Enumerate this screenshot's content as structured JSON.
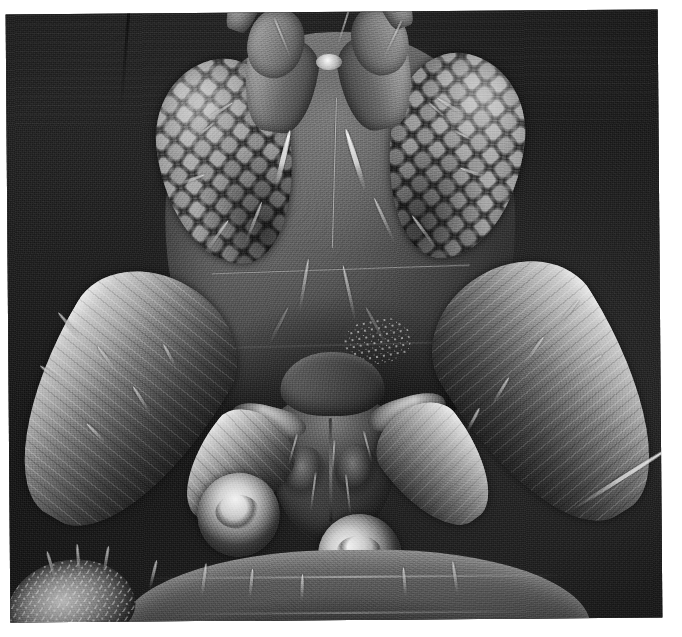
{
  "figure": {
    "type": "scanning-electron-micrograph",
    "colour_mode": "greyscale",
    "scale_bar_present": false,
    "caption_present": false,
    "border": {
      "style": "white paper margin",
      "colour": "#ffffff",
      "left_px": 8,
      "top_px": 12,
      "right_px": 22,
      "bottom_px": 17
    },
    "plate": {
      "background_colour": "#121212",
      "highlight_colour": "#f2f2f2",
      "midtone_colour": "#6a6a6a",
      "rotation_deg": -0.45
    }
  },
  "anatomy": {
    "head_capsule": {
      "label": "head capsule",
      "description": "broad rounded frons with fine punctate cuticle and scattered pale setae"
    },
    "eyes": [
      {
        "label": "compound eye (left)",
        "side": "left",
        "facets": "coarse ommatidia in overlapping rows"
      },
      {
        "label": "compound eye (right)",
        "side": "right",
        "facets": "coarse ommatidia in overlapping rows"
      }
    ],
    "antennae": [
      {
        "label": "antenna (left)",
        "side": "left",
        "segments": [
          "scape",
          "pedicel",
          "flagellum"
        ]
      },
      {
        "label": "antenna (right)",
        "side": "right",
        "segments": [
          "scape",
          "pedicel",
          "flagellum"
        ]
      }
    ],
    "mouthparts": {
      "label": "mouthparts",
      "parts": [
        "labrum",
        "labium",
        "maxillary palp"
      ]
    },
    "appendages": [
      {
        "label": "foreleg femur (left)",
        "side": "left"
      },
      {
        "label": "foreleg tibia (left)",
        "side": "left"
      },
      {
        "label": "foreleg tarsus (left)",
        "side": "left"
      },
      {
        "label": "foreleg femur (right)",
        "side": "right"
      },
      {
        "label": "foreleg tibia (right)",
        "side": "right"
      },
      {
        "label": "foreleg tarsus (right)",
        "side": "right"
      },
      {
        "label": "tarsal claw cluster",
        "side": "lower-left"
      }
    ],
    "thorax": {
      "label": "prothorax",
      "description": "transversely banded segment along the lower edge of the frame"
    },
    "setae": {
      "label": "setae",
      "description": "bright tapering bristles on head, limbs and thorax"
    }
  }
}
